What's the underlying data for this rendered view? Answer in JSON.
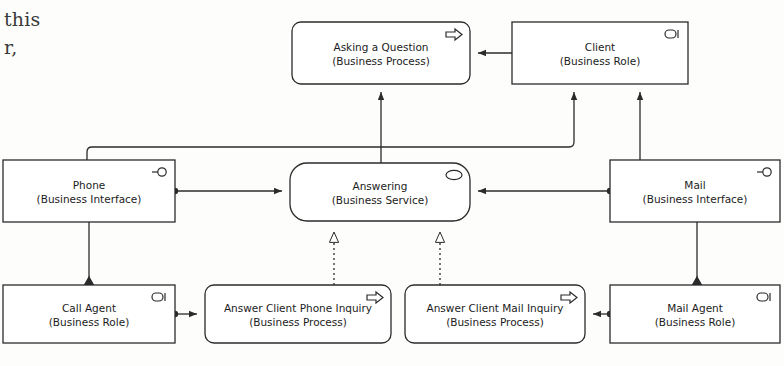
{
  "diagram": {
    "bleed_text": {
      "line1": "this",
      "line2": "r,"
    },
    "stroke_color": "#2b2b2b",
    "fill_color": "#ffffff",
    "nodes": [
      {
        "id": "asking",
        "name": "Asking a Question",
        "stereotype": "(Business Process)",
        "icon": "business-process-arrow-icon",
        "shape": "rounded",
        "x": 292,
        "y": 22,
        "w": 178,
        "h": 62
      },
      {
        "id": "client",
        "name": "Client",
        "stereotype": "(Business Role)",
        "icon": "business-role-cylinder-icon",
        "shape": "rect",
        "x": 512,
        "y": 22,
        "w": 176,
        "h": 62
      },
      {
        "id": "phone",
        "name": "Phone",
        "stereotype": "(Business Interface)",
        "icon": "business-interface-lollipop-icon",
        "shape": "rect",
        "x": 3,
        "y": 160,
        "w": 172,
        "h": 62
      },
      {
        "id": "answering",
        "name": "Answering",
        "stereotype": "(Business Service)",
        "icon": "business-service-oval-icon",
        "shape": "stadium",
        "x": 290,
        "y": 163,
        "w": 180,
        "h": 58
      },
      {
        "id": "mail",
        "name": "Mail",
        "stereotype": "(Business Interface)",
        "icon": "business-interface-lollipop-icon",
        "shape": "rect",
        "x": 610,
        "y": 160,
        "w": 170,
        "h": 62
      },
      {
        "id": "call_agent",
        "name": "Call Agent",
        "stereotype": "(Business Role)",
        "icon": "business-role-cylinder-icon",
        "shape": "rect",
        "x": 3,
        "y": 285,
        "w": 172,
        "h": 58
      },
      {
        "id": "phone_inquiry",
        "name": "Answer Client Phone Inquiry",
        "stereotype": "(Business Process)",
        "icon": "business-process-arrow-icon",
        "shape": "rounded",
        "x": 205,
        "y": 285,
        "w": 186,
        "h": 58
      },
      {
        "id": "mail_inquiry",
        "name": "Answer Client Mail Inquiry",
        "stereotype": "(Business Process)",
        "icon": "business-process-arrow-icon",
        "shape": "rounded",
        "x": 405,
        "y": 285,
        "w": 180,
        "h": 58
      },
      {
        "id": "mail_agent",
        "name": "Mail Agent",
        "stereotype": "(Business Role)",
        "icon": "business-role-cylinder-icon",
        "shape": "rect",
        "x": 610,
        "y": 285,
        "w": 170,
        "h": 58
      }
    ],
    "connections": [
      {
        "id": "client-to-asking",
        "type": "association-arrow",
        "from": "client",
        "to": "asking"
      },
      {
        "id": "answering-to-asking",
        "type": "association-arrow",
        "from": "answering",
        "to": "asking"
      },
      {
        "id": "phone-to-client",
        "type": "association-arrow",
        "from": "phone",
        "to": "client"
      },
      {
        "id": "mail-to-client",
        "type": "association-arrow",
        "from": "mail",
        "to": "client"
      },
      {
        "id": "phone-to-answering",
        "type": "association-arrow",
        "from": "phone",
        "to": "answering"
      },
      {
        "id": "mail-to-answering",
        "type": "association-arrow",
        "from": "mail",
        "to": "answering"
      },
      {
        "id": "phone-inquiry-realizes",
        "type": "realization-dotted",
        "from": "phone_inquiry",
        "to": "answering"
      },
      {
        "id": "mail-inquiry-realizes",
        "type": "realization-dotted",
        "from": "mail_inquiry",
        "to": "answering"
      },
      {
        "id": "phone-composes-call-agent",
        "type": "composition-diamond",
        "from": "phone",
        "to": "call_agent"
      },
      {
        "id": "mail-composes-mail-agent",
        "type": "composition-diamond",
        "from": "mail",
        "to": "mail_agent"
      },
      {
        "id": "call-agent-to-phone-inquiry",
        "type": "association-arrow",
        "from": "call_agent",
        "to": "phone_inquiry"
      },
      {
        "id": "mail-agent-to-mail-inquiry",
        "type": "association-arrow",
        "from": "mail_agent",
        "to": "mail_inquiry"
      }
    ]
  }
}
